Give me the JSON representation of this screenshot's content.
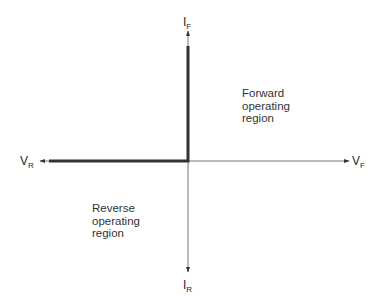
{
  "diagram": {
    "type": "diode operating quadrants (I-V axes)",
    "axes": {
      "positive_y": {
        "main": "I",
        "sub": "F"
      },
      "negative_y": {
        "main": "I",
        "sub": "R"
      },
      "positive_x": {
        "main": "V",
        "sub": "F"
      },
      "negative_x": {
        "main": "V",
        "sub": "R"
      }
    },
    "regions": {
      "forward": [
        "Forward",
        "operating",
        "region"
      ],
      "reverse": [
        "Reverse",
        "operating",
        "region"
      ]
    },
    "colors": {
      "axis": "#555555",
      "characteristic": "#333333",
      "text": "#2a2a2a"
    }
  }
}
